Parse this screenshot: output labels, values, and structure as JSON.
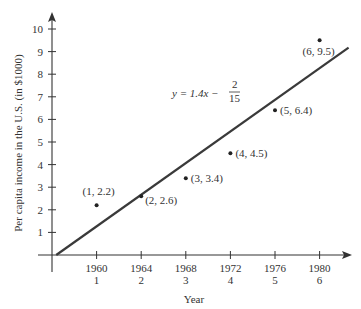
{
  "chart_data": {
    "type": "scatter",
    "title": "",
    "xlabel": "Year",
    "ylabel": "Per capita income in the U.S. (in $1000)",
    "x_ticks": [
      {
        "x": 1,
        "year": "1960",
        "index": "1"
      },
      {
        "x": 2,
        "year": "1964",
        "index": "2"
      },
      {
        "x": 3,
        "year": "1968",
        "index": "3"
      },
      {
        "x": 4,
        "year": "1972",
        "index": "4"
      },
      {
        "x": 5,
        "year": "1976",
        "index": "5"
      },
      {
        "x": 6,
        "year": "1980",
        "index": "6"
      }
    ],
    "y_ticks": [
      "1",
      "2",
      "3",
      "4",
      "5",
      "6",
      "7",
      "8",
      "9",
      "10"
    ],
    "xlim": [
      0,
      6.7
    ],
    "ylim": [
      0,
      10.5
    ],
    "grid": false,
    "points": [
      {
        "x": 1,
        "y": 2.2,
        "label": "(1, 2.2)"
      },
      {
        "x": 2,
        "y": 2.6,
        "label": "(2, 2.6)"
      },
      {
        "x": 3,
        "y": 3.4,
        "label": "(3, 3.4)"
      },
      {
        "x": 4,
        "y": 4.5,
        "label": "(4, 4.5)"
      },
      {
        "x": 5,
        "y": 6.4,
        "label": "(5, 6.4)"
      },
      {
        "x": 6,
        "y": 9.5,
        "label": "(6, 9.5)"
      }
    ],
    "regression_line": {
      "slope": 1.4,
      "intercept": -0.1333,
      "equation_lhs": "y = 1.4x −",
      "equation_num": "2",
      "equation_den": "15"
    }
  }
}
